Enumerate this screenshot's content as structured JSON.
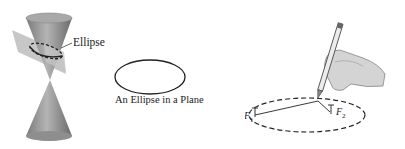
{
  "figure": {
    "panels": [
      {
        "id": "double-cone",
        "label": "Ellipse"
      },
      {
        "id": "ellipse-in-plane",
        "caption": "An Ellipse in a Plane"
      },
      {
        "id": "string-construction",
        "foci": [
          "F1",
          "F2"
        ]
      }
    ]
  },
  "labels": {
    "cone_section": "Ellipse",
    "plane_caption": "An Ellipse in a Plane",
    "focus1_main": "F",
    "focus1_sub": "1",
    "focus2_main": "F",
    "focus2_sub": "2"
  },
  "colors": {
    "cone_fill": "#9a9a9a",
    "cone_dark": "#6e6e6e",
    "plane_fill": "#b8b8b8",
    "stroke": "#222222",
    "hand_fill": "#d6d6d6"
  }
}
